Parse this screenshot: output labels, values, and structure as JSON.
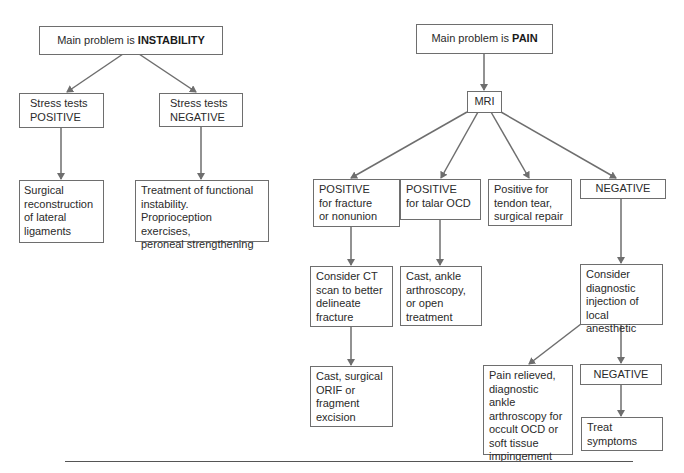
{
  "colors": {
    "stroke": "#6e6e6e",
    "text": "#2a2a2a",
    "background": "#ffffff"
  },
  "nodes": {
    "instability": {
      "prefix": "Main problem is ",
      "emphasis": "INSTABILITY"
    },
    "stress_positive": {
      "lines": [
        "Stress tests",
        "POSITIVE"
      ]
    },
    "stress_negative": {
      "lines": [
        "Stress tests",
        "NEGATIVE"
      ]
    },
    "surgical_reconstruction": {
      "lines": [
        "Surgical",
        "reconstruction",
        "of lateral",
        "ligaments"
      ]
    },
    "functional_treatment": {
      "lines": [
        "Treatment of functional",
        "instability.",
        "Proprioception exercises,",
        "peroneal strengthening"
      ]
    },
    "pain": {
      "prefix": "Main problem is ",
      "emphasis": "PAIN"
    },
    "mri": {
      "label": "MRI"
    },
    "positive_fracture": {
      "lines": [
        "POSITIVE",
        "for fracture",
        "or nonunion"
      ]
    },
    "positive_talar_ocd": {
      "lines": [
        "POSITIVE",
        "for talar OCD"
      ]
    },
    "tendon_tear": {
      "lines": [
        "Positive for",
        "tendon tear,",
        "surgical repair"
      ]
    },
    "mri_negative": {
      "label": "NEGATIVE"
    },
    "consider_ct": {
      "lines": [
        "Consider CT",
        "scan to better",
        "delineate",
        "fracture"
      ]
    },
    "cast_ankle": {
      "lines": [
        "Cast, ankle",
        "arthroscopy,",
        "or open",
        "treatment"
      ]
    },
    "consider_injection": {
      "lines": [
        "Consider",
        "diagnostic",
        "injection of",
        "local anesthetic"
      ]
    },
    "cast_surgical": {
      "lines": [
        "Cast, surgical",
        "ORIF or",
        "fragment",
        "excision"
      ]
    },
    "pain_relieved": {
      "lines": [
        "Pain relieved,",
        "diagnostic ankle",
        "arthroscopy for",
        "occult OCD or",
        "soft tissue",
        "impingement"
      ]
    },
    "injection_negative": {
      "label": "NEGATIVE"
    },
    "treat_symptoms": {
      "lines": [
        "Treat",
        "symptoms"
      ]
    }
  }
}
